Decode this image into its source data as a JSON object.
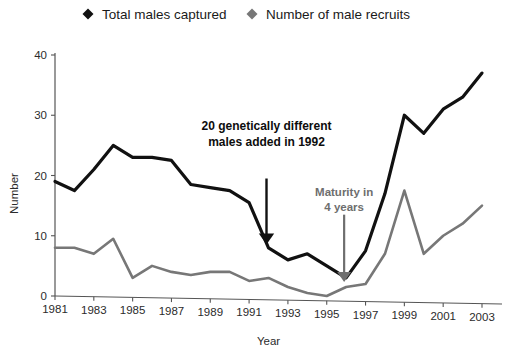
{
  "chart_data": {
    "type": "line",
    "title": "",
    "xlabel": "Year",
    "ylabel": "Number",
    "xlim": [
      1981,
      2003
    ],
    "ylim": [
      0,
      40
    ],
    "yticks": [
      0,
      10,
      20,
      30,
      40
    ],
    "xticks": [
      1981,
      1983,
      1985,
      1987,
      1989,
      1991,
      1993,
      1995,
      1997,
      1999,
      2001,
      2003
    ],
    "grid": false,
    "legend_position": "top",
    "x": [
      1981,
      1982,
      1983,
      1984,
      1985,
      1986,
      1987,
      1988,
      1989,
      1990,
      1991,
      1992,
      1993,
      1994,
      1995,
      1996,
      1997,
      1998,
      1999,
      2000,
      2001,
      2002,
      2003
    ],
    "series": [
      {
        "name": "Total males captured",
        "color": "#111111",
        "marker": "diamond",
        "values": [
          19,
          17.5,
          21,
          25,
          23,
          23,
          22.5,
          18.5,
          18,
          17.5,
          15.5,
          8,
          6,
          7,
          5,
          3,
          7.5,
          17,
          30,
          27,
          31,
          33,
          37
        ]
      },
      {
        "name": "Number of male recruits",
        "color": "#777777",
        "marker": "diamond",
        "values": [
          8,
          8,
          7,
          9.5,
          3,
          5,
          4,
          3.5,
          4,
          4,
          2.5,
          3,
          1.5,
          0.5,
          0,
          1.5,
          2,
          7,
          17.5,
          7,
          10,
          12,
          15
        ]
      }
    ],
    "annotations": [
      {
        "id": "added-males",
        "lines": [
          "20 genetically different",
          "males added in 1992"
        ],
        "style": "bold-black",
        "arrow": {
          "from_year": 1992.0,
          "from_value": 19.5,
          "to_year": 1992.0,
          "to_value": 9.5,
          "color": "#111111"
        }
      },
      {
        "id": "maturity",
        "lines": [
          "Maturity in",
          "4 years"
        ],
        "style": "bold-gray",
        "arrow": {
          "from_year": 1996.0,
          "from_value": 13.5,
          "to_year": 1996.0,
          "to_value": 3.2,
          "color": "#6e6e6e"
        }
      }
    ]
  },
  "legend": {
    "items": [
      {
        "label": "Total males captured",
        "color": "#111111"
      },
      {
        "label": "Number of male recruits",
        "color": "#777777"
      }
    ]
  },
  "axes": {
    "x_title": "Year",
    "y_title": "Number"
  }
}
